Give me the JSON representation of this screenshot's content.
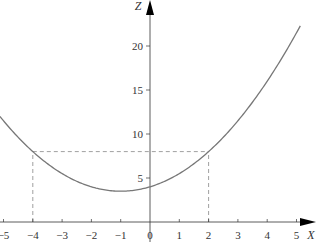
{
  "chart_data": {
    "type": "line",
    "title": "",
    "xlabel": "X",
    "ylabel": "Z",
    "xlim": [
      -5.1,
      5.5
    ],
    "ylim": [
      0,
      25
    ],
    "grid": false,
    "x_ticks": [
      -5,
      -4,
      -3,
      -2,
      -1,
      0,
      1,
      2,
      3,
      4,
      5
    ],
    "y_ticks": [
      5,
      10,
      15,
      20
    ],
    "series": [
      {
        "name": "z = 0.5(x+1)^2 + 3.5",
        "x": [
          -5.1,
          -5,
          -4,
          -3,
          -2,
          -1,
          0,
          1,
          2,
          3,
          4,
          5,
          5.1
        ],
        "values": [
          11.9,
          11.5,
          8,
          5.5,
          4,
          3.5,
          4,
          5.5,
          8,
          11.5,
          16,
          21.5,
          22.1
        ]
      }
    ],
    "annotations": [
      {
        "type": "dashed-vertical",
        "x": -4,
        "from": 0,
        "to": 8
      },
      {
        "type": "dashed-vertical",
        "x": 2,
        "from": 0,
        "to": 8
      },
      {
        "type": "dashed-horizontal",
        "y": 8,
        "from": -4,
        "to": 2
      }
    ]
  },
  "colors": {
    "axis": "#333333",
    "curve": "#777777",
    "dash": "#888888"
  }
}
